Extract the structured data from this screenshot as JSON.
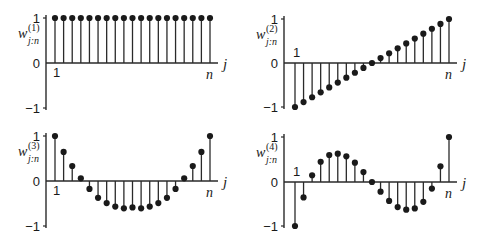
{
  "chart_data": [
    {
      "type": "stem",
      "panel": "top-left",
      "ylabel_base": "w",
      "ylabel_sub": "j:n",
      "ylabel_sup": "(1)",
      "xlabel": "j",
      "x_start_label": "1",
      "x_end_label": "n",
      "yticks": [
        "1",
        "0",
        "−1"
      ],
      "ylim": [
        -1,
        1
      ],
      "n_points": 19,
      "values": [
        1,
        1,
        1,
        1,
        1,
        1,
        1,
        1,
        1,
        1,
        1,
        1,
        1,
        1,
        1,
        1,
        1,
        1,
        1
      ]
    },
    {
      "type": "stem",
      "panel": "top-right",
      "ylabel_base": "w",
      "ylabel_sub": "j:n",
      "ylabel_sup": "(2)",
      "xlabel": "j",
      "x_start_label": "1",
      "x_end_label": "n",
      "yticks": [
        "1",
        "0",
        "−1"
      ],
      "ylim": [
        -1,
        1
      ],
      "n_points": 19,
      "values": [
        -1,
        -0.889,
        -0.778,
        -0.667,
        -0.556,
        -0.444,
        -0.333,
        -0.222,
        -0.111,
        0,
        0.111,
        0.222,
        0.333,
        0.444,
        0.556,
        0.667,
        0.778,
        0.889,
        1
      ]
    },
    {
      "type": "stem",
      "panel": "bottom-left",
      "ylabel_base": "w",
      "ylabel_sub": "j:n",
      "ylabel_sup": "(3)",
      "xlabel": "j",
      "x_start_label": "1",
      "x_end_label": "n",
      "yticks": [
        "1",
        "0",
        "−1"
      ],
      "ylim": [
        -1,
        1
      ],
      "n_points": 19,
      "values": [
        1,
        0.647,
        0.333,
        0.059,
        -0.176,
        -0.373,
        -0.49,
        -0.569,
        -0.608,
        -0.588,
        -0.608,
        -0.569,
        -0.49,
        -0.373,
        -0.176,
        0.059,
        0.333,
        0.647,
        1
      ]
    },
    {
      "type": "stem",
      "panel": "bottom-right",
      "ylabel_base": "w",
      "ylabel_sub": "j:n",
      "ylabel_sup": "(4)",
      "xlabel": "j",
      "x_start_label": "1",
      "x_end_label": "n",
      "yticks": [
        "1",
        "0",
        "−1"
      ],
      "ylim": [
        -1,
        1
      ],
      "n_points": 19,
      "values": [
        -1,
        -0.35,
        0.15,
        0.45,
        0.6,
        0.63,
        0.57,
        0.43,
        0.22,
        0,
        -0.22,
        -0.43,
        -0.57,
        -0.63,
        -0.6,
        -0.45,
        -0.15,
        0.35,
        1
      ]
    }
  ]
}
